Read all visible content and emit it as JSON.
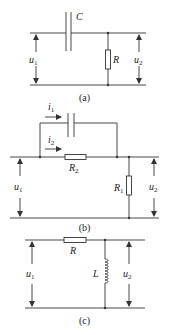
{
  "figures": [
    {
      "id": "a",
      "caption": "(a)",
      "components": {
        "capacitor": "C",
        "resistor": "R"
      },
      "input_voltage": {
        "sym": "u",
        "sub": "1"
      },
      "output_voltage": {
        "sym": "u",
        "sub": "2"
      }
    },
    {
      "id": "b",
      "caption": "(b)",
      "components": {
        "capacitor": "",
        "series_resistor": {
          "sym": "R",
          "sub": "2"
        },
        "shunt_resistor": {
          "sym": "R",
          "sub": "1"
        }
      },
      "currents": [
        {
          "sym": "i",
          "sub": "1"
        },
        {
          "sym": "i",
          "sub": "2"
        }
      ],
      "input_voltage": {
        "sym": "u",
        "sub": "1"
      },
      "output_voltage": {
        "sym": "u",
        "sub": "2"
      }
    },
    {
      "id": "c",
      "caption": "(c)",
      "components": {
        "resistor": "R",
        "inductor": "L"
      },
      "input_voltage": {
        "sym": "u",
        "sub": "1"
      },
      "output_voltage": {
        "sym": "u",
        "sub": "2"
      }
    }
  ]
}
